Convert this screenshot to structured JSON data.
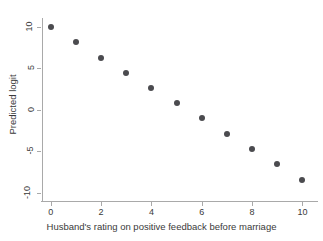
{
  "chart_data": {
    "type": "scatter",
    "title": "",
    "xlabel": "Husband's rating on positive feedback before marriage",
    "ylabel": "Predicted logit",
    "x": [
      0,
      1,
      2,
      3,
      4,
      5,
      6,
      7,
      8,
      9,
      10
    ],
    "values": [
      9.9,
      8.1,
      6.2,
      4.4,
      2.6,
      0.8,
      -1.0,
      -2.9,
      -4.7,
      -6.5,
      -8.4
    ],
    "series": [
      {
        "name": "Predicted logit",
        "x": [
          0,
          1,
          2,
          3,
          4,
          5,
          6,
          7,
          8,
          9,
          10
        ],
        "values": [
          9.9,
          8.1,
          6.2,
          4.4,
          2.6,
          0.8,
          -1.0,
          -2.9,
          -4.7,
          -6.5,
          -8.4
        ]
      }
    ],
    "xlim": [
      -0.35,
      10.5
    ],
    "ylim": [
      -10.6,
      10.8
    ],
    "xticks": [
      0,
      2,
      4,
      6,
      8,
      10
    ],
    "xtick_labels": [
      "0",
      "2",
      "4",
      "6",
      "8",
      "10"
    ],
    "yticks": [
      10,
      5,
      0,
      -5,
      -10
    ],
    "ytick_labels": [
      "10",
      "5",
      "0",
      "-5",
      "-10"
    ],
    "grid": false,
    "legend": false,
    "marker_color": "#4b4b4f",
    "axis_color": "#a9a9a9",
    "background_color": "#ffffff"
  }
}
